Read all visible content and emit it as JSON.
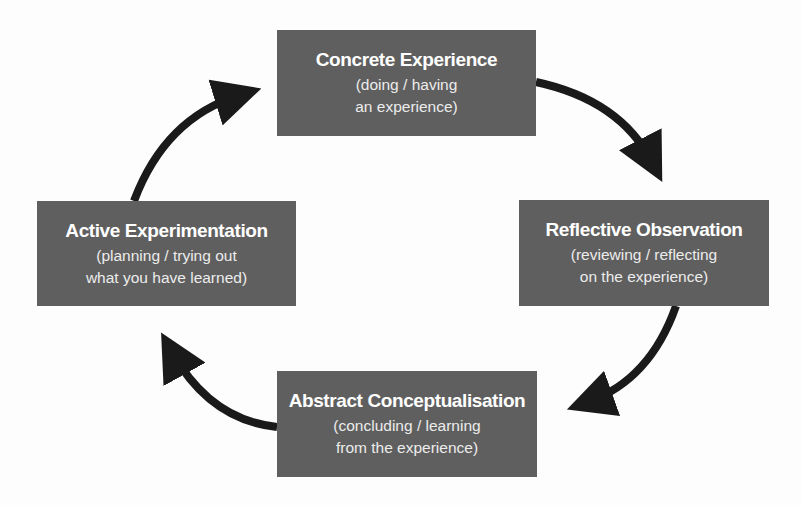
{
  "diagram": {
    "colors": {
      "box_fill": "#5f5f5f",
      "box_text": "#ffffff",
      "arrow": "#1a1a1a",
      "background": "#fdfdfd"
    },
    "stages": [
      {
        "id": "concrete-experience",
        "title": "Concrete Experience",
        "subtitle_line1": "(doing / having",
        "subtitle_line2": "an experience)"
      },
      {
        "id": "reflective-observation",
        "title": "Reflective Observation",
        "subtitle_line1": "(reviewing / reflecting",
        "subtitle_line2": "on the experience)"
      },
      {
        "id": "abstract-conceptualisation",
        "title": "Abstract Conceptualisation",
        "subtitle_line1": "(concluding / learning",
        "subtitle_line2": "from the experience)"
      },
      {
        "id": "active-experimentation",
        "title": "Active Experimentation",
        "subtitle_line1": "(planning / trying out",
        "subtitle_line2": "what you have learned)"
      }
    ],
    "flow": [
      {
        "from": "concrete-experience",
        "to": "reflective-observation",
        "direction": "clockwise"
      },
      {
        "from": "reflective-observation",
        "to": "abstract-conceptualisation",
        "direction": "clockwise"
      },
      {
        "from": "abstract-conceptualisation",
        "to": "active-experimentation",
        "direction": "clockwise"
      },
      {
        "from": "active-experimentation",
        "to": "concrete-experience",
        "direction": "clockwise"
      }
    ]
  }
}
